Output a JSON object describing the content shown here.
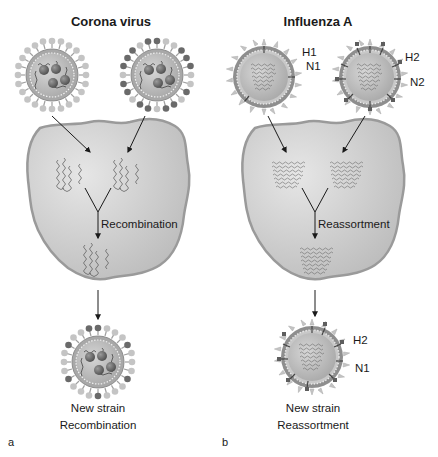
{
  "panels": [
    {
      "letter": "a",
      "title": "Corona virus",
      "process_label": "Recombination",
      "result_line1": "New strain",
      "result_line2": "Recombination"
    },
    {
      "letter": "b",
      "title": "Influenza A",
      "process_label": "Reassortment",
      "result_line1": "New strain",
      "result_line2": "Reassortment",
      "parent1_labels": [
        "H1",
        "N1"
      ],
      "parent2_labels": [
        "H2",
        "N2"
      ],
      "offspring_labels": [
        "H2",
        "N1"
      ]
    }
  ],
  "icons": {
    "coronavirus": "coronavirus-particle-icon",
    "influenza": "influenza-virion-icon",
    "host_cell": "host-cell-icon",
    "genome": "viral-genome-icon"
  },
  "colors": {
    "cell_fill": "#c8c8c8",
    "cell_outline": "#9a9a9a",
    "virus_body": "#b4b4b4",
    "spike_light": "#bdbdbd",
    "spike_dark": "#6e6e6e",
    "arrow": "#1a1a1a"
  }
}
